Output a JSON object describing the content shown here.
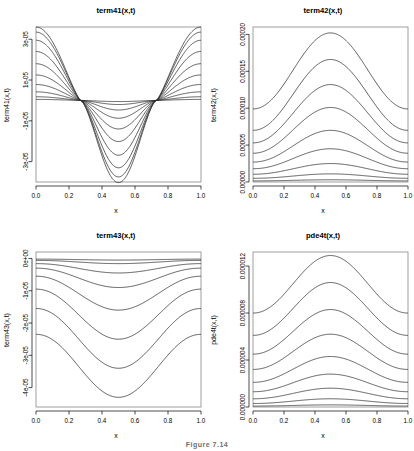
{
  "figure": {
    "background": "#ffffff",
    "grid_layout": "2x2",
    "caption_partial": "Figure 7.14"
  },
  "chart_data": [
    {
      "id": "term41",
      "position": "top-left",
      "type": "line",
      "title": "term41(x,t)",
      "xlabel": "x",
      "ylabel": "term41(x,t)",
      "xlim": [
        0.0,
        1.0
      ],
      "ylim": [
        -4e-05,
        3.6e-05
      ],
      "grid": false,
      "legend": null,
      "xticks": [
        "0.0",
        "0.2",
        "0.4",
        "0.6",
        "0.8",
        "1.0"
      ],
      "xtick_values": [
        0.0,
        0.2,
        0.4,
        0.6,
        0.8,
        1.0
      ],
      "yticks": [
        "3e-05",
        "1e-05",
        "-1e-05",
        "-3e-05"
      ],
      "ytick_values": [
        3e-05,
        1e-05,
        -1e-05,
        -3e-05
      ],
      "shape": "cosine-node",
      "node_x": [
        0.27,
        0.73
      ],
      "series": [
        {
          "name": "t1",
          "amplitude": 5e-07
        },
        {
          "name": "t2",
          "amplitude": 1.8e-06
        },
        {
          "name": "t3",
          "amplitude": 4.2e-06
        },
        {
          "name": "t4",
          "amplitude": 7.8e-06
        },
        {
          "name": "t5",
          "amplitude": 1.25e-05
        },
        {
          "name": "t6",
          "amplitude": 1.8e-05
        },
        {
          "name": "t7",
          "amplitude": 2.4e-05
        },
        {
          "name": "t8",
          "amplitude": 2.95e-05
        },
        {
          "name": "t9",
          "amplitude": 3.35e-05
        },
        {
          "name": "t10",
          "amplitude": 3.6e-05
        }
      ]
    },
    {
      "id": "term42",
      "position": "top-right",
      "type": "line",
      "title": "term42(x,t)",
      "xlabel": "x",
      "ylabel": "term42(x,t)",
      "xlim": [
        0.0,
        1.0
      ],
      "ylim": [
        0.0,
        0.00021
      ],
      "grid": false,
      "legend": null,
      "xticks": [
        "0.0",
        "0.2",
        "0.4",
        "0.6",
        "0.8",
        "1.0"
      ],
      "xtick_values": [
        0.0,
        0.2,
        0.4,
        0.6,
        0.8,
        1.0
      ],
      "yticks": [
        "0.00000",
        "0.00005",
        "0.00010",
        "0.00015",
        "0.00020"
      ],
      "ytick_values": [
        0.0,
        5e-05,
        0.0001,
        0.00015,
        0.0002
      ],
      "shape": "bell-positive",
      "series": [
        {
          "name": "t1",
          "baseline": 1.5e-06,
          "peak": 3e-06
        },
        {
          "name": "t2",
          "baseline": 5e-06,
          "peak": 1.1e-05
        },
        {
          "name": "t3",
          "baseline": 1.05e-05,
          "peak": 2.5e-05
        },
        {
          "name": "t4",
          "baseline": 1.8e-05,
          "peak": 4.5e-05
        },
        {
          "name": "t5",
          "baseline": 2.7e-05,
          "peak": 7e-05
        },
        {
          "name": "t6",
          "baseline": 3.9e-05,
          "peak": 0.000101
        },
        {
          "name": "t7",
          "baseline": 5.3e-05,
          "peak": 0.000132
        },
        {
          "name": "t8",
          "baseline": 7e-05,
          "peak": 0.000166
        },
        {
          "name": "t9",
          "baseline": 9.9e-05,
          "peak": 0.000202
        }
      ]
    },
    {
      "id": "term43",
      "position": "bottom-left",
      "type": "line",
      "title": "term43(x,t)",
      "xlabel": "x",
      "ylabel": "term43(x,t)",
      "xlim": [
        0.0,
        1.0
      ],
      "ylim": [
        -4.6e-05,
        2e-06
      ],
      "grid": false,
      "legend": null,
      "xticks": [
        "0.0",
        "0.2",
        "0.4",
        "0.6",
        "0.8",
        "1.0"
      ],
      "xtick_values": [
        0.0,
        0.2,
        0.4,
        0.6,
        0.8,
        1.0
      ],
      "yticks": [
        "0e+00",
        "-1e-05",
        "-2e-05",
        "-3e-05",
        "-4e-05"
      ],
      "ytick_values": [
        0.0,
        -1e-05,
        -2e-05,
        -3e-05,
        -4e-05
      ],
      "shape": "bell-negative",
      "series": [
        {
          "name": "t1",
          "baseline": -2e-07,
          "trough": -5e-07
        },
        {
          "name": "t2",
          "baseline": -6e-07,
          "trough": -1.6e-06
        },
        {
          "name": "t3",
          "baseline": -1.6e-06,
          "trough": -4.5e-06
        },
        {
          "name": "t4",
          "baseline": -3e-06,
          "trough": -9e-06
        },
        {
          "name": "t5",
          "baseline": -5.5e-06,
          "trough": -1.6e-05
        },
        {
          "name": "t6",
          "baseline": -9.5e-06,
          "trough": -2.5e-05
        },
        {
          "name": "t7",
          "baseline": -1.55e-05,
          "trough": -3.4e-05
        },
        {
          "name": "t8",
          "baseline": -2.35e-05,
          "trough": -4.3e-05
        }
      ]
    },
    {
      "id": "pde4t",
      "position": "bottom-right",
      "type": "line",
      "title": "pde4t(x,t)",
      "xlabel": "x",
      "ylabel": "pde4t(x,t)",
      "xlim": [
        0.0,
        1.0
      ],
      "ylim": [
        0.0,
        1.32e-05
      ],
      "grid": false,
      "legend": null,
      "xticks": [
        "0.0",
        "0.2",
        "0.4",
        "0.6",
        "0.8",
        "1.0"
      ],
      "xtick_values": [
        0.0,
        0.2,
        0.4,
        0.6,
        0.8,
        1.0
      ],
      "yticks": [
        "0.000000",
        "0.000004",
        "0.000008",
        "0.000012"
      ],
      "ytick_values": [
        0.0,
        4e-06,
        8e-06,
        1.2e-05
      ],
      "shape": "bell-positive",
      "series": [
        {
          "name": "t1",
          "baseline": 8e-08,
          "peak": 1.8e-07
        },
        {
          "name": "t2",
          "baseline": 3e-07,
          "peak": 7e-07
        },
        {
          "name": "t3",
          "baseline": 7e-07,
          "peak": 1.6e-06
        },
        {
          "name": "t4",
          "baseline": 1.3e-06,
          "peak": 2.8e-06
        },
        {
          "name": "t5",
          "baseline": 2.1e-06,
          "peak": 4.3e-06
        },
        {
          "name": "t6",
          "baseline": 3.2e-06,
          "peak": 6.2e-06
        },
        {
          "name": "t7",
          "baseline": 4.5e-06,
          "peak": 8.3e-06
        },
        {
          "name": "t8",
          "baseline": 6.1e-06,
          "peak": 1.06e-05
        },
        {
          "name": "t9",
          "baseline": 8e-06,
          "peak": 1.29e-05
        }
      ]
    }
  ]
}
